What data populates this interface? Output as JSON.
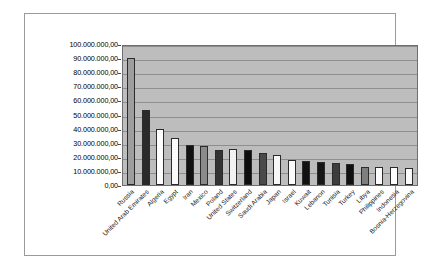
{
  "chart_data": {
    "type": "bar",
    "title": "",
    "subtitle": "",
    "xlabel": "",
    "ylabel": "",
    "ylim": [
      0,
      100000000
    ],
    "grid": true,
    "legend": "none",
    "number_format": "european",
    "categories": [
      "Russia",
      "United Arab Emirates",
      "Algeria",
      "Egypt",
      "Iran",
      "Mexico",
      "Poland",
      "United States",
      "Switzerland",
      "Saudi Arabia",
      "Japan",
      "Israel",
      "Kuwait",
      "Lebanon",
      "Tunisia",
      "Turkey",
      "Libya",
      "Philippines",
      "Indonesia",
      "Bosnia-Herzegovina"
    ],
    "values": [
      90000000,
      53000000,
      40000000,
      33000000,
      28500000,
      28000000,
      25000000,
      25200000,
      25000000,
      23000000,
      21500000,
      18000000,
      17000000,
      16000000,
      15500000,
      15000000,
      13000000,
      12500000,
      12500000,
      12000000
    ],
    "bar_colors": [
      "#9e9e9e",
      "#2a2a2a",
      "#fdfdfd",
      "#fbfbfb",
      "#111111",
      "#8a8a8a",
      "#343434",
      "#f2f2f2",
      "#0d0d0d",
      "#4a4a4a",
      "#f7f7f7",
      "#fbfbfb",
      "#121212",
      "#161616",
      "#3d3d3d",
      "#101010",
      "#7e7e7e",
      "#fbfbfb",
      "#fdfdfd",
      "#fbfbfb"
    ],
    "y_ticks": [
      "100.000.000,00",
      "90.000.000,00",
      "80.000.000,00",
      "70.000.000,00",
      "60.000.000,00",
      "50.000.000,00",
      "40.000.000,00",
      "30.000.000,00",
      "20.000.000,00",
      "10.000.000,00",
      "0,00"
    ],
    "y_tick_values": [
      100000000,
      90000000,
      80000000,
      70000000,
      60000000,
      50000000,
      40000000,
      30000000,
      20000000,
      10000000,
      0
    ],
    "plot_background": "#bdbdbd",
    "chart_background": "#ffffff",
    "gridline_color": "#8e8e8e",
    "axis_color": "#6e6e6e"
  }
}
